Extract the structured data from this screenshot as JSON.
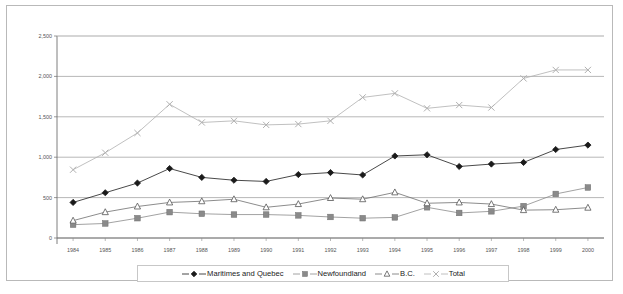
{
  "chart_data": {
    "type": "line",
    "title": "",
    "xlabel": "",
    "ylabel": "",
    "ylim": [
      0,
      2500
    ],
    "ytick_labels": [
      "0",
      "500",
      "1,000",
      "1,500",
      "2,000",
      "2,500"
    ],
    "ytick_values": [
      0,
      500,
      1000,
      1500,
      2000,
      2500
    ],
    "grid": true,
    "legend_position": "bottom",
    "categories": [
      "1984",
      "1985",
      "1986",
      "1987",
      "1988",
      "1989",
      "1990",
      "1991",
      "1992",
      "1993",
      "1994",
      "1995",
      "1996",
      "1997",
      "1998",
      "1999",
      "2000"
    ],
    "series": [
      {
        "name": "Maritimes and Quebec",
        "marker": "diamond",
        "color": "#1a1a1a",
        "values": [
          440,
          560,
          680,
          860,
          750,
          715,
          700,
          785,
          810,
          780,
          1015,
          1030,
          885,
          915,
          935,
          1095,
          1150
        ]
      },
      {
        "name": "Newfoundland",
        "marker": "square",
        "color": "#8a8a8a",
        "values": [
          165,
          180,
          245,
          320,
          300,
          290,
          290,
          280,
          260,
          245,
          255,
          380,
          310,
          330,
          395,
          545,
          625
        ]
      },
      {
        "name": "B.C.",
        "marker": "triangle",
        "color": "#6e6e6e",
        "values": [
          215,
          320,
          390,
          440,
          455,
          480,
          380,
          420,
          495,
          480,
          565,
          430,
          440,
          420,
          345,
          350,
          375
        ]
      },
      {
        "name": "Total",
        "marker": "x",
        "color": "#b0b0b0",
        "values": [
          845,
          1055,
          1300,
          1655,
          1430,
          1450,
          1400,
          1410,
          1450,
          1740,
          1790,
          1605,
          1645,
          1615,
          1975,
          2080,
          2080
        ]
      }
    ]
  },
  "legend": {
    "items": [
      {
        "label": "Maritimes and Quebec",
        "marker": "diamond"
      },
      {
        "label": "Newfoundland",
        "marker": "square"
      },
      {
        "label": "B.C.",
        "marker": "triangle"
      },
      {
        "label": "Total",
        "marker": "x"
      }
    ]
  }
}
